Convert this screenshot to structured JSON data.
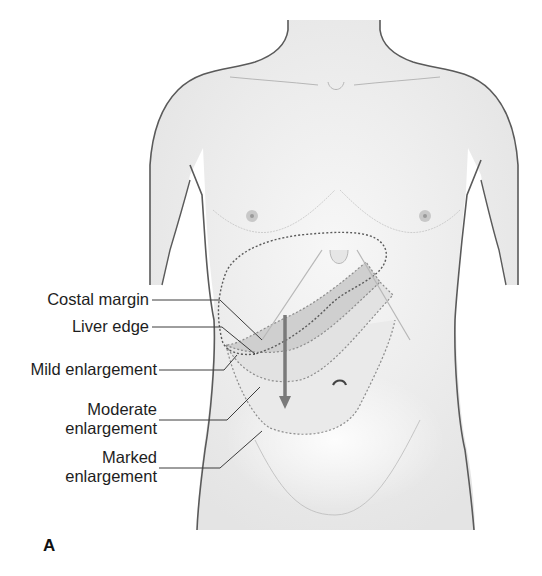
{
  "figure": {
    "panel_letter": "A",
    "labels": [
      {
        "id": "costal-margin",
        "text": "Costal margin"
      },
      {
        "id": "liver-edge",
        "text": "Liver edge"
      },
      {
        "id": "mild-enlargement",
        "text": "Mild enlargement"
      },
      {
        "id": "moderate-enlargement",
        "line1": "Moderate",
        "line2": "enlargement"
      },
      {
        "id": "marked-enlargement",
        "line1": "Marked",
        "line2": "enlargement"
      }
    ]
  },
  "colors": {
    "outline": "#5a5a5a",
    "skin": "#ececec",
    "mild_region": "#cfcfcf",
    "moderate_region": "#e2e2e2",
    "arrow": "#7a7a7a",
    "text": "#1e1e1e"
  }
}
